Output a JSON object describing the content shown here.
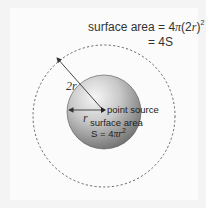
{
  "diagram": {
    "outer_label": {
      "line1_prefix": "surface area = 4",
      "line1_pi": "π",
      "line1_paren_open": "(2",
      "line1_r": "r",
      "line1_paren_close": ")",
      "line1_exp": "2",
      "line2": "= 4S"
    },
    "inner_label": {
      "source": "point source",
      "area_line1": "surface area",
      "area_line2_prefix": "S = 4",
      "area_line2_pi": "π",
      "area_line2_r": "r",
      "area_line2_exp": "2"
    },
    "radius_labels": {
      "outer": "2r",
      "inner": "r"
    },
    "colors": {
      "sphere_light": "#f2f2f2",
      "sphere_dark": "#7a7a7a",
      "dashed_circle": "#555555",
      "arrow": "#333333",
      "background": "#f4f4f4"
    }
  }
}
